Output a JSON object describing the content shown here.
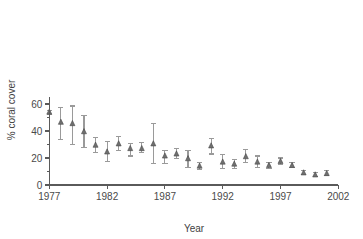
{
  "chart_data": {
    "type": "scatter",
    "title": "",
    "subtitle": "",
    "xlabel": "Year",
    "ylabel": "% coral cover",
    "xlim": [
      1977,
      2002
    ],
    "ylim": [
      0,
      65
    ],
    "xticks": [
      1977,
      1982,
      1987,
      1992,
      1997,
      2002
    ],
    "xtick_labels": [
      "1977",
      "1982",
      "1987",
      "1992",
      "1997",
      "2002"
    ],
    "yticks": [
      0,
      20,
      40,
      60
    ],
    "ytick_labels": [
      "0",
      "20",
      "40",
      "60"
    ],
    "yticks_minor": [
      10,
      30,
      50
    ],
    "grid": false,
    "legend": "none",
    "marker": "triangle",
    "marker_color": "#6f6f6f",
    "errorbar_color": "#9a9a9a",
    "axis_color": "#5a5a5a",
    "error_type": "error bars (mean +/- range)",
    "x": [
      1977,
      1978,
      1979,
      1980,
      1981,
      1982,
      1983,
      1984,
      1985,
      1986,
      1987,
      1988,
      1989,
      1990,
      1991,
      1992,
      1993,
      1994,
      1995,
      1996,
      1997,
      1998,
      1999,
      2000,
      2001
    ],
    "values": [
      54.0,
      46.5,
      45.5,
      39.5,
      29.5,
      24.5,
      30.5,
      27.0,
      27.0,
      30.5,
      21.5,
      23.0,
      19.5,
      14.0,
      29.0,
      17.0,
      15.5,
      21.0,
      17.0,
      14.5,
      17.5,
      14.5,
      9.0,
      7.5,
      8.5
    ],
    "y_upper": [
      55.5,
      57.5,
      58.5,
      51.5,
      35.0,
      32.5,
      36.0,
      31.0,
      31.5,
      45.5,
      25.5,
      27.0,
      25.5,
      17.0,
      34.5,
      22.5,
      19.0,
      26.5,
      21.5,
      17.0,
      20.0,
      16.5,
      10.5,
      9.0,
      10.5
    ],
    "y_lower": [
      52.5,
      33.5,
      30.0,
      27.5,
      24.0,
      17.5,
      25.5,
      21.5,
      24.0,
      16.0,
      16.0,
      19.5,
      13.0,
      11.5,
      23.0,
      12.5,
      12.0,
      16.5,
      13.0,
      12.5,
      15.0,
      13.0,
      7.5,
      6.5,
      7.0
    ]
  },
  "figure": {
    "x_axis_label": "Year",
    "y_axis_label": "% coral cover"
  }
}
